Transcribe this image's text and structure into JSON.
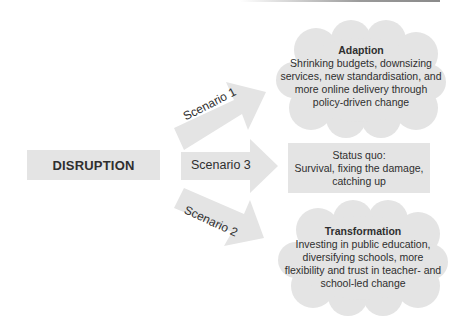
{
  "diagram": {
    "source": {
      "label": "DISRUPTION"
    },
    "arrows": [
      {
        "id": "scenario-1",
        "label": "Scenario 1",
        "direction": "up-right"
      },
      {
        "id": "scenario-3",
        "label": "Scenario 3",
        "direction": "right"
      },
      {
        "id": "scenario-2",
        "label": "Scenario 2",
        "direction": "down-right"
      }
    ],
    "outcomes": {
      "adaption": {
        "title": "Adaption",
        "lines": [
          "Shrinking budgets, downsizing",
          "services, new standardisation, and",
          "more online delivery through",
          "policy-driven change"
        ]
      },
      "status_quo": {
        "title": "Status quo:",
        "lines": [
          "Survival, fixing the damage,",
          "catching up"
        ]
      },
      "transformation": {
        "title": "Transformation",
        "lines": [
          "Investing in public education,",
          "diversifying schools, more",
          "flexibility and trust in teacher- and",
          "school-led change"
        ]
      }
    },
    "colors": {
      "fill": "#e4e4e4",
      "text": "#2f2f2f",
      "background": "#ffffff"
    }
  }
}
